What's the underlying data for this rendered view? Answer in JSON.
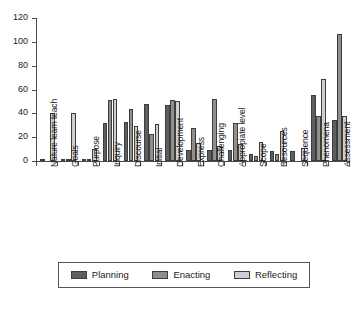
{
  "chart_data": {
    "type": "bar",
    "title": "",
    "subtitle": "",
    "xlabel": "",
    "ylabel": "",
    "ylim": [
      0,
      120
    ],
    "yticks": [
      0,
      20,
      40,
      60,
      80,
      100,
      120
    ],
    "grid": false,
    "legend_position": "bottom",
    "categories": [
      "Nature learn teach",
      "Goals",
      "Purpose",
      "Inquiry",
      "Discourse",
      "Initial",
      "Development",
      "Express",
      "Challenging",
      "Appropiate level",
      "Scope",
      "Resources",
      "Sequence",
      "Phenomena",
      "Assessment"
    ],
    "series": [
      {
        "name": "Planning",
        "color": "#5e5e5e",
        "values": [
          2,
          1,
          2,
          32,
          33,
          48,
          47,
          9,
          9,
          9,
          6,
          8,
          8,
          55,
          34
        ]
      },
      {
        "name": "Enacting",
        "color": "#8f8f8f",
        "values": [
          0,
          2,
          1,
          51,
          44,
          23,
          51,
          28,
          52,
          32,
          4,
          6,
          0,
          38,
          107
        ]
      },
      {
        "name": "Reflecting",
        "color": "#cfcfcf",
        "values": [
          40,
          40,
          10,
          52,
          29,
          31,
          50,
          15,
          13,
          14,
          16,
          25,
          11,
          69,
          38
        ]
      }
    ]
  },
  "legend": {
    "items": [
      {
        "label": "Planning",
        "color": "#5e5e5e"
      },
      {
        "label": "Enacting",
        "color": "#8f8f8f"
      },
      {
        "label": "Reflecting",
        "color": "#cfcfcf"
      }
    ]
  },
  "axis": {
    "y_tick_labels": [
      "0",
      "20",
      "40",
      "60",
      "80",
      "100",
      "120"
    ]
  }
}
